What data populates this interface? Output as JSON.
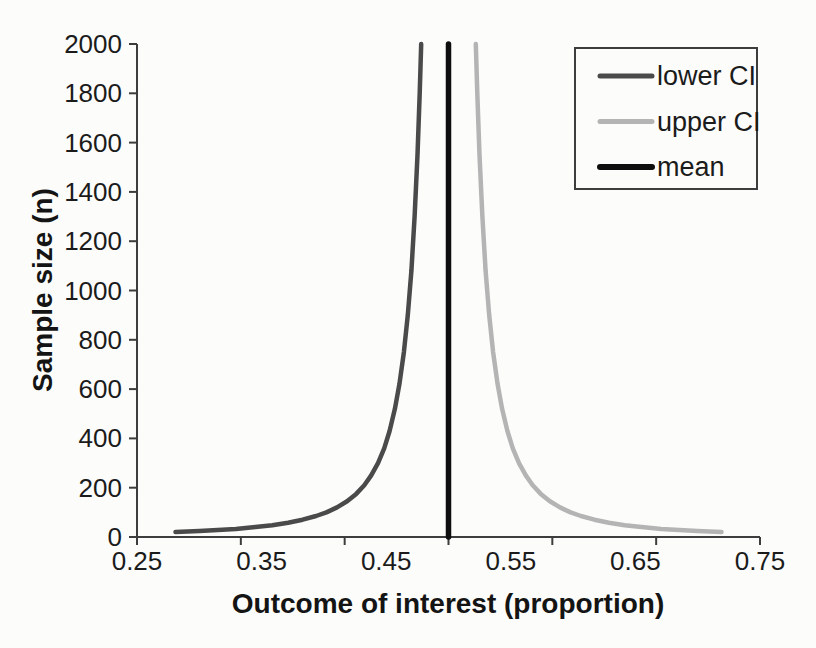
{
  "page": {
    "background_color": "#fcfcfa"
  },
  "chart_data": {
    "type": "line",
    "title": "",
    "xlabel": "Outcome of interest (proportion)",
    "ylabel": "Sample size (n)",
    "xlim": [
      0.25,
      0.75
    ],
    "ylim": [
      0,
      2000
    ],
    "x_tick_labels": [
      "0.25",
      "0.35",
      "0.45",
      "0.55",
      "0.65",
      "0.75"
    ],
    "x_axis_tick_segments": 6,
    "y_ticks": [
      0,
      200,
      400,
      600,
      800,
      1000,
      1200,
      1400,
      1600,
      1800,
      2000
    ],
    "grid": "off",
    "axis_color": "#3d3d3d",
    "text_color": "#1b1b1b",
    "legend": {
      "position": "top-right",
      "border_color": "#3d3d3d",
      "background": "#fcfcfa"
    },
    "series": [
      {
        "name": "lower CI",
        "color": "#4a4a4a",
        "width": 4.5,
        "points": [
          [
            0.2809,
            20
          ],
          [
            0.3,
            24
          ],
          [
            0.3148,
            28
          ],
          [
            0.3294,
            33
          ],
          [
            0.345,
            40
          ],
          [
            0.3586,
            48
          ],
          [
            0.3713,
            58
          ],
          [
            0.3829,
            70
          ],
          [
            0.3937,
            85
          ],
          [
            0.402,
            100
          ],
          [
            0.4105,
            120
          ],
          [
            0.4186,
            145
          ],
          [
            0.4259,
            175
          ],
          [
            0.4324,
            210
          ],
          [
            0.438,
            250
          ],
          [
            0.4434,
            300
          ],
          [
            0.4484,
            360
          ],
          [
            0.4527,
            430
          ],
          [
            0.457,
            520
          ],
          [
            0.4606,
            620
          ],
          [
            0.4642,
            750
          ],
          [
            0.4673,
            900
          ],
          [
            0.4702,
            1080
          ],
          [
            0.4728,
            1300
          ],
          [
            0.4751,
            1550
          ],
          [
            0.4769,
            1800
          ],
          [
            0.4781,
            2000
          ]
        ]
      },
      {
        "name": "upper CI",
        "color": "#b4b4b4",
        "width": 4.5,
        "points": [
          [
            0.7191,
            20
          ],
          [
            0.7,
            24
          ],
          [
            0.6852,
            28
          ],
          [
            0.6706,
            33
          ],
          [
            0.655,
            40
          ],
          [
            0.6414,
            48
          ],
          [
            0.6287,
            58
          ],
          [
            0.6171,
            70
          ],
          [
            0.6063,
            85
          ],
          [
            0.598,
            100
          ],
          [
            0.5895,
            120
          ],
          [
            0.5814,
            145
          ],
          [
            0.5741,
            175
          ],
          [
            0.5676,
            210
          ],
          [
            0.562,
            250
          ],
          [
            0.5566,
            300
          ],
          [
            0.5516,
            360
          ],
          [
            0.5473,
            430
          ],
          [
            0.543,
            520
          ],
          [
            0.5394,
            620
          ],
          [
            0.5358,
            750
          ],
          [
            0.5327,
            900
          ],
          [
            0.5298,
            1080
          ],
          [
            0.5272,
            1300
          ],
          [
            0.5249,
            1550
          ],
          [
            0.5231,
            1800
          ],
          [
            0.5219,
            2000
          ]
        ]
      },
      {
        "name": "mean",
        "color": "#0e0e0e",
        "width": 5.5,
        "points": [
          [
            0.5,
            0
          ],
          [
            0.5,
            2000
          ]
        ]
      }
    ]
  }
}
